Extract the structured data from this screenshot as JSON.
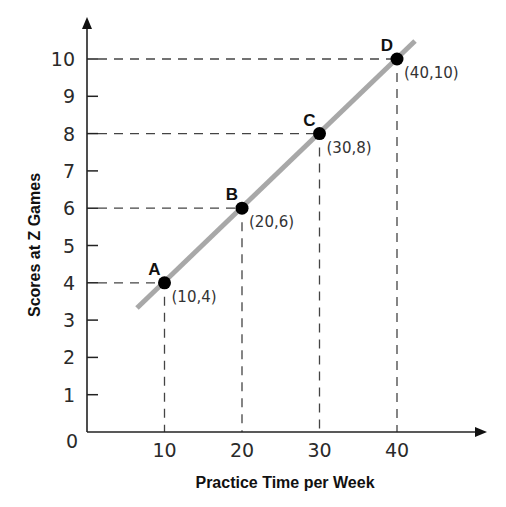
{
  "chart_data": {
    "type": "line",
    "title": "",
    "xlabel": "Practice Time per Week",
    "ylabel": "Scores at Z Games",
    "xlim": [
      0,
      50
    ],
    "ylim": [
      0,
      11
    ],
    "x_ticks": [
      "10",
      "20",
      "30",
      "40"
    ],
    "y_ticks": [
      "1",
      "2",
      "3",
      "4",
      "5",
      "6",
      "7",
      "8",
      "9",
      "10"
    ],
    "origin_label": "0",
    "grid": false,
    "series": [
      {
        "name": "Score vs Practice",
        "x": [
          10,
          20,
          30,
          40
        ],
        "y": [
          4,
          6,
          8,
          10
        ]
      }
    ],
    "points": [
      {
        "label": "A",
        "x": 10,
        "y": 4,
        "coord_text": "(10,4)"
      },
      {
        "label": "B",
        "x": 20,
        "y": 6,
        "coord_text": "(20,6)"
      },
      {
        "label": "C",
        "x": 30,
        "y": 8,
        "coord_text": "(30,8)"
      },
      {
        "label": "D",
        "x": 40,
        "y": 10,
        "coord_text": "(40,10)"
      }
    ],
    "colors": {
      "line": "#a8a8a8",
      "point": "#000000",
      "axis": "#222222",
      "guide": "#444444"
    }
  }
}
